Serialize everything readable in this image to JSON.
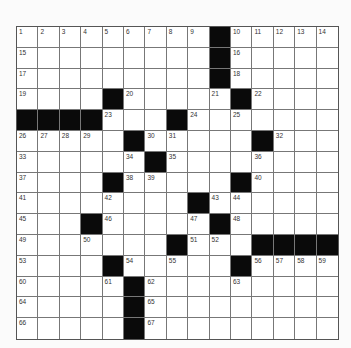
{
  "puzzle": {
    "rows": 15,
    "cols": 15,
    "colors": {
      "black": "#0a0a0a",
      "white": "#ffffff",
      "grid_line": "#777777"
    },
    "layout": [
      "000000000#00000",
      "000000000#00000",
      "000000000#00000",
      "0000#00000#0000",
      "####000#0000000",
      "00000#00000#000",
      "000000#00000000",
      "0000#00000#0000",
      "00000000#000000",
      "000#00000#00000",
      "0000000#000####",
      "0000#00000#0000",
      "00000#000000000",
      "00000#000000000",
      "00000#000000000"
    ],
    "numbers": {
      "0,0": "1",
      "0,1": "2",
      "0,2": "3",
      "0,3": "4",
      "0,4": "5",
      "0,5": "6",
      "0,6": "7",
      "0,7": "8",
      "0,8": "9",
      "0,10": "10",
      "0,11": "11",
      "0,12": "12",
      "0,13": "13",
      "0,14": "14",
      "1,0": "15",
      "1,10": "16",
      "2,0": "17",
      "2,10": "18",
      "3,0": "19",
      "3,5": "20",
      "3,9": "21",
      "3,11": "22",
      "4,4": "23",
      "4,8": "24",
      "4,10": "25",
      "5,0": "26",
      "5,1": "27",
      "5,2": "28",
      "5,3": "29",
      "5,6": "30",
      "5,7": "31",
      "5,12": "32",
      "6,0": "33",
      "6,5": "34",
      "6,7": "35",
      "6,11": "36",
      "7,0": "37",
      "7,5": "38",
      "7,6": "39",
      "7,11": "40",
      "8,0": "41",
      "8,4": "42",
      "8,9": "43",
      "8,10": "44",
      "9,0": "45",
      "9,4": "46",
      "9,8": "47",
      "9,10": "48",
      "10,0": "49",
      "10,3": "50",
      "10,8": "51",
      "10,9": "52",
      "11,0": "53",
      "11,5": "54",
      "11,7": "55",
      "11,11": "56",
      "11,12": "57",
      "11,13": "58",
      "11,14": "59",
      "12,0": "60",
      "12,4": "61",
      "12,6": "62",
      "12,10": "63",
      "13,0": "64",
      "13,6": "65",
      "14,0": "66",
      "14,6": "67"
    }
  }
}
